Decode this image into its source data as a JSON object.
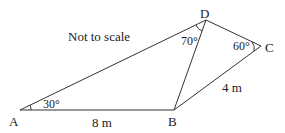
{
  "diagram": {
    "note": "Not to scale",
    "points": {
      "A": {
        "label": "A",
        "x": 20,
        "y": 110
      },
      "B": {
        "label": "B",
        "x": 174,
        "y": 110
      },
      "C": {
        "label": "C",
        "x": 261,
        "y": 46
      },
      "D": {
        "label": "D",
        "x": 206,
        "y": 20
      }
    },
    "segments": [
      {
        "from": "A",
        "to": "B",
        "label": "8 m"
      },
      {
        "from": "B",
        "to": "C",
        "label": "4 m"
      },
      {
        "from": "C",
        "to": "D",
        "label": ""
      },
      {
        "from": "D",
        "to": "A",
        "label": ""
      },
      {
        "from": "D",
        "to": "B",
        "label": ""
      }
    ],
    "angles": {
      "A": "30°",
      "D": "70°",
      "C": "60°"
    }
  }
}
